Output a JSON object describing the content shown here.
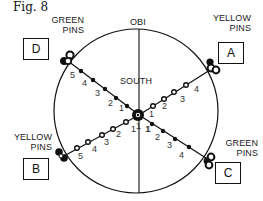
{
  "figure": {
    "title": "Fig. 8",
    "top_label": "OBI",
    "center_label": "SOUTH"
  },
  "corners": {
    "A": {
      "box": "A",
      "label_line1": "YELLOW",
      "label_line2": "PINS"
    },
    "B": {
      "box": "B",
      "label_line1": "YELLOW",
      "label_line2": "PINS"
    },
    "C": {
      "box": "C",
      "label_line1": "GREEN",
      "label_line2": "PINS"
    },
    "D": {
      "box": "D",
      "label_line1": "GREEN",
      "label_line2": "PINS"
    }
  },
  "spokes": {
    "D_numbers": [
      "1",
      "2",
      "3",
      "4",
      "5"
    ],
    "A_numbers": [
      "1",
      "2",
      "3",
      "4"
    ],
    "B_numbers": [
      "1",
      "2",
      "3",
      "4",
      "5"
    ],
    "C_numbers": [
      "1",
      "2",
      "3",
      "4"
    ],
    "bottom_left_num": "1",
    "bottom_right_num": "1"
  },
  "colors": {
    "ink": "#111111",
    "background": "#ffffff"
  }
}
